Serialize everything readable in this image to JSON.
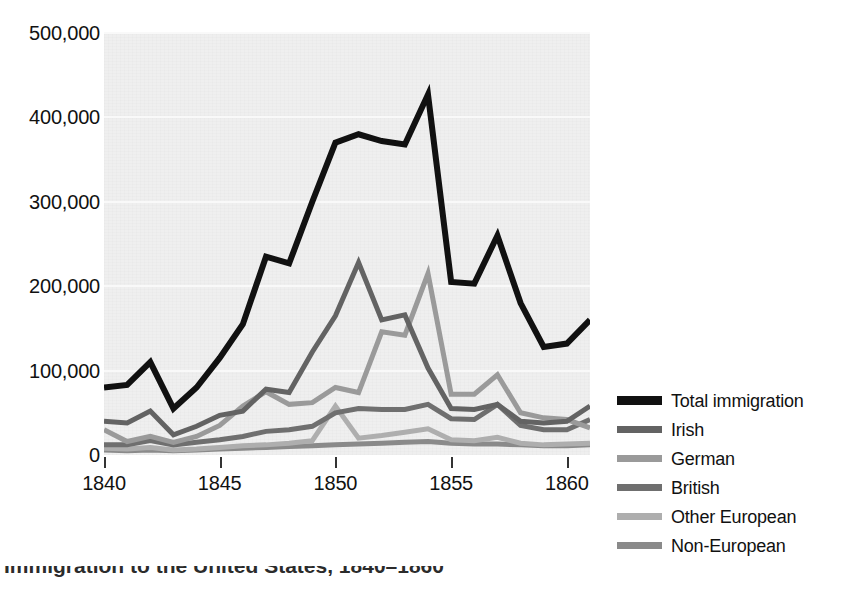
{
  "chart_data": {
    "type": "line",
    "title": "",
    "xlabel": "",
    "ylabel": "",
    "xlim": [
      1840,
      1861
    ],
    "ylim": [
      0,
      500000
    ],
    "grid": true,
    "legend_position": "right",
    "x": [
      1840,
      1841,
      1842,
      1843,
      1844,
      1845,
      1846,
      1847,
      1848,
      1849,
      1850,
      1851,
      1852,
      1853,
      1854,
      1855,
      1856,
      1857,
      1858,
      1859,
      1860,
      1861
    ],
    "xticks": [
      1840,
      1845,
      1850,
      1855,
      1860
    ],
    "xtick_labels": [
      "1840",
      "1845",
      "1850",
      "1855",
      "1860"
    ],
    "yticks": [
      0,
      100000,
      200000,
      300000,
      400000,
      500000
    ],
    "ytick_labels": [
      "0",
      "100,000",
      "200,000",
      "300,000",
      "400,000",
      "500,000"
    ],
    "series": [
      {
        "name": "Total immigration",
        "color": "#111111",
        "values": [
          80000,
          83000,
          110000,
          55000,
          80000,
          115000,
          155000,
          235000,
          227000,
          300000,
          370000,
          380000,
          372000,
          368000,
          427000,
          205000,
          203000,
          260000,
          180000,
          128000,
          132000,
          160000
        ]
      },
      {
        "name": "Irish",
        "color": "#636363",
        "values": [
          40000,
          38000,
          52000,
          24000,
          34000,
          47000,
          52000,
          78000,
          74000,
          122000,
          165000,
          228000,
          160000,
          166000,
          103000,
          55000,
          54000,
          60000,
          40000,
          38000,
          40000,
          58000
        ]
      },
      {
        "name": "German",
        "color": "#9a9a9a",
        "values": [
          30000,
          16000,
          22000,
          15000,
          22000,
          35000,
          58000,
          75000,
          60000,
          62000,
          80000,
          74000,
          146000,
          142000,
          215000,
          72000,
          72000,
          95000,
          50000,
          44000,
          42000,
          32000
        ]
      },
      {
        "name": "British",
        "color": "#6f6f6f",
        "values": [
          12000,
          12000,
          17000,
          12000,
          15000,
          18000,
          22000,
          28000,
          30000,
          34000,
          50000,
          55000,
          54000,
          54000,
          60000,
          43000,
          42000,
          60000,
          35000,
          30000,
          30000,
          42000
        ]
      },
      {
        "name": "Other European",
        "color": "#aeaeae",
        "values": [
          8000,
          7000,
          9000,
          6000,
          7000,
          9000,
          11000,
          12000,
          14000,
          17000,
          58000,
          20000,
          23000,
          27000,
          31000,
          18000,
          17000,
          21000,
          14000,
          12000,
          13000,
          14000
        ]
      },
      {
        "name": "Non-European",
        "color": "#8a8a8a",
        "values": [
          6000,
          5000,
          6000,
          5000,
          6000,
          7000,
          8000,
          9000,
          10000,
          11000,
          12000,
          13000,
          14000,
          15000,
          16000,
          14000,
          13000,
          13000,
          12000,
          11000,
          11000,
          12000
        ]
      }
    ]
  },
  "legend": {
    "items": [
      {
        "label": "Total immigration",
        "color": "#111111"
      },
      {
        "label": "Irish",
        "color": "#636363"
      },
      {
        "label": "German",
        "color": "#9a9a9a"
      },
      {
        "label": "British",
        "color": "#6f6f6f"
      },
      {
        "label": "Other European",
        "color": "#aeaeae"
      },
      {
        "label": "Non-European",
        "color": "#8a8a8a"
      }
    ]
  },
  "caption": {
    "text": "Immigration to the United States, 1840–1860"
  },
  "colors": {
    "plot_background": "#efefef",
    "gridline": "#f9f9f9",
    "page_background": "#ffffff",
    "text": "#111111"
  }
}
